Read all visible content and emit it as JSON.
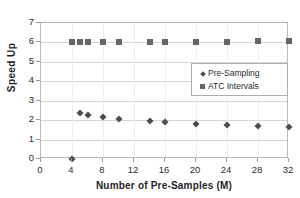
{
  "chart_data": {
    "type": "scatter",
    "title": "",
    "xlabel": "Number of Pre-Samples (M)",
    "ylabel": "Speed Up",
    "xlim": [
      0,
      32
    ],
    "ylim": [
      0,
      7
    ],
    "xticks": [
      "0",
      "4",
      "8",
      "12",
      "16",
      "20",
      "24",
      "28",
      "32"
    ],
    "yticks": [
      "0",
      "1",
      "2",
      "3",
      "4",
      "5",
      "6",
      "7"
    ],
    "grid": "horizontal",
    "legend_position": "inside-right",
    "series": [
      {
        "name": "Pre-Sampling",
        "marker": "diamond",
        "color": "#4d4d4d",
        "x": [
          4,
          5,
          6,
          8,
          10,
          14,
          16,
          20,
          24,
          28,
          32
        ],
        "values": [
          0.02,
          2.35,
          2.28,
          2.18,
          2.08,
          1.96,
          1.88,
          1.78,
          1.76,
          1.68,
          1.67
        ]
      },
      {
        "name": "ATC Intervals",
        "marker": "square",
        "color": "#666666",
        "x": [
          4,
          5,
          6,
          8,
          10,
          14,
          16,
          20,
          24,
          28,
          32
        ],
        "values": [
          6.02,
          6.04,
          6.03,
          6.03,
          6.03,
          6.03,
          6.03,
          6.04,
          6.04,
          6.06,
          6.06
        ]
      }
    ]
  },
  "legend": {
    "items": [
      {
        "label": "Pre-Sampling",
        "marker": "diamond"
      },
      {
        "label": "ATC Intervals",
        "marker": "square"
      }
    ]
  }
}
